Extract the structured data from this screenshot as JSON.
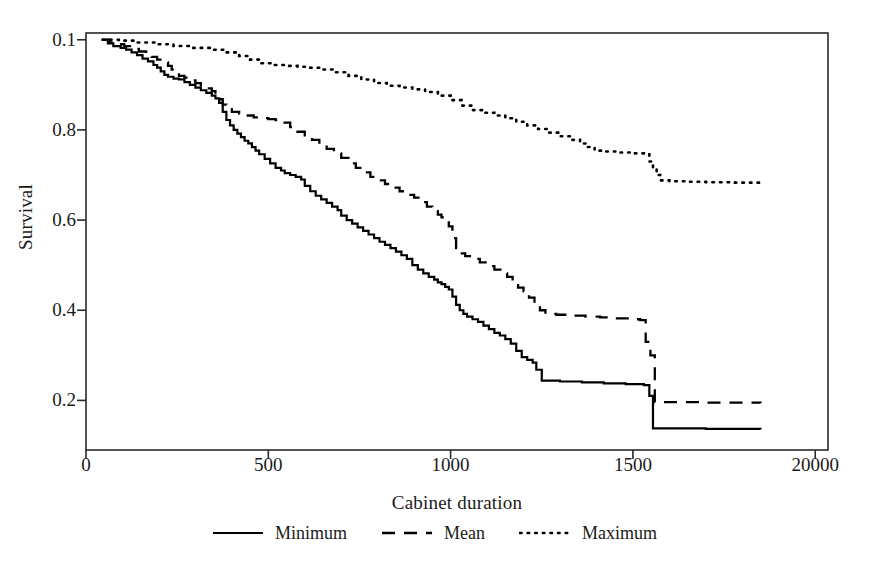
{
  "chart_data": {
    "type": "line",
    "title": "",
    "subtitle": "",
    "xlabel": "Cabinet duration",
    "ylabel": "Survival",
    "xlim": [
      0,
      2035
    ],
    "ylim": [
      0.09,
      1.015
    ],
    "grid": false,
    "legend_position": "bottom-center",
    "xticks": [
      {
        "value": 0,
        "label": "0"
      },
      {
        "value": 500,
        "label": "500"
      },
      {
        "value": 1000,
        "label": "1000"
      },
      {
        "value": 1500,
        "label": "1500"
      },
      {
        "value": 2000,
        "label": "20000"
      }
    ],
    "yticks": [
      {
        "value": 1.0,
        "label": "0.1"
      },
      {
        "value": 0.8,
        "label": "0.8"
      },
      {
        "value": 0.6,
        "label": "0.6"
      },
      {
        "value": 0.4,
        "label": "0.4"
      },
      {
        "value": 0.2,
        "label": "0.2"
      }
    ],
    "note_on_tick_labels": "Top y tick prints as 0.1 and last x tick prints as 20000 exactly as rendered in the source image",
    "series": [
      {
        "name": "Minimum",
        "style": "solid",
        "color": "#000000",
        "points": [
          [
            45,
            1.0
          ],
          [
            60,
            0.992
          ],
          [
            75,
            0.986
          ],
          [
            95,
            0.982
          ],
          [
            110,
            0.978
          ],
          [
            125,
            0.972
          ],
          [
            140,
            0.966
          ],
          [
            155,
            0.958
          ],
          [
            170,
            0.952
          ],
          [
            185,
            0.944
          ],
          [
            195,
            0.938
          ],
          [
            205,
            0.93
          ],
          [
            215,
            0.922
          ],
          [
            225,
            0.918
          ],
          [
            240,
            0.914
          ],
          [
            255,
            0.912
          ],
          [
            270,
            0.906
          ],
          [
            285,
            0.9
          ],
          [
            300,
            0.894
          ],
          [
            315,
            0.888
          ],
          [
            330,
            0.882
          ],
          [
            345,
            0.876
          ],
          [
            355,
            0.87
          ],
          [
            365,
            0.86
          ],
          [
            375,
            0.84
          ],
          [
            385,
            0.822
          ],
          [
            395,
            0.81
          ],
          [
            405,
            0.8
          ],
          [
            415,
            0.792
          ],
          [
            425,
            0.784
          ],
          [
            435,
            0.776
          ],
          [
            445,
            0.77
          ],
          [
            455,
            0.762
          ],
          [
            465,
            0.754
          ],
          [
            475,
            0.746
          ],
          [
            490,
            0.736
          ],
          [
            505,
            0.726
          ],
          [
            520,
            0.716
          ],
          [
            535,
            0.71
          ],
          [
            545,
            0.704
          ],
          [
            560,
            0.7
          ],
          [
            575,
            0.696
          ],
          [
            590,
            0.69
          ],
          [
            600,
            0.676
          ],
          [
            615,
            0.664
          ],
          [
            630,
            0.654
          ],
          [
            645,
            0.646
          ],
          [
            660,
            0.638
          ],
          [
            675,
            0.63
          ],
          [
            690,
            0.622
          ],
          [
            700,
            0.61
          ],
          [
            715,
            0.6
          ],
          [
            730,
            0.592
          ],
          [
            745,
            0.584
          ],
          [
            760,
            0.576
          ],
          [
            775,
            0.568
          ],
          [
            790,
            0.56
          ],
          [
            805,
            0.552
          ],
          [
            820,
            0.545
          ],
          [
            835,
            0.538
          ],
          [
            850,
            0.53
          ],
          [
            865,
            0.522
          ],
          [
            880,
            0.514
          ],
          [
            895,
            0.5
          ],
          [
            910,
            0.49
          ],
          [
            925,
            0.482
          ],
          [
            940,
            0.474
          ],
          [
            955,
            0.468
          ],
          [
            965,
            0.462
          ],
          [
            975,
            0.458
          ],
          [
            985,
            0.452
          ],
          [
            995,
            0.446
          ],
          [
            1005,
            0.43
          ],
          [
            1015,
            0.412
          ],
          [
            1025,
            0.4
          ],
          [
            1035,
            0.392
          ],
          [
            1045,
            0.386
          ],
          [
            1060,
            0.38
          ],
          [
            1075,
            0.374
          ],
          [
            1090,
            0.366
          ],
          [
            1105,
            0.358
          ],
          [
            1120,
            0.35
          ],
          [
            1135,
            0.344
          ],
          [
            1150,
            0.336
          ],
          [
            1165,
            0.326
          ],
          [
            1180,
            0.31
          ],
          [
            1195,
            0.296
          ],
          [
            1210,
            0.29
          ],
          [
            1225,
            0.284
          ],
          [
            1235,
            0.268
          ],
          [
            1250,
            0.244
          ],
          [
            1300,
            0.242
          ],
          [
            1360,
            0.24
          ],
          [
            1420,
            0.238
          ],
          [
            1480,
            0.236
          ],
          [
            1530,
            0.234
          ],
          [
            1545,
            0.21
          ],
          [
            1555,
            0.138
          ],
          [
            1700,
            0.137
          ],
          [
            1850,
            0.136
          ]
        ]
      },
      {
        "name": "Mean",
        "style": "dashed",
        "color": "#000000",
        "points": [
          [
            45,
            1.0
          ],
          [
            65,
            0.994
          ],
          [
            85,
            0.99
          ],
          [
            105,
            0.986
          ],
          [
            125,
            0.98
          ],
          [
            145,
            0.974
          ],
          [
            165,
            0.968
          ],
          [
            180,
            0.962
          ],
          [
            195,
            0.956
          ],
          [
            210,
            0.95
          ],
          [
            225,
            0.942
          ],
          [
            235,
            0.934
          ],
          [
            245,
            0.926
          ],
          [
            255,
            0.92
          ],
          [
            270,
            0.916
          ],
          [
            285,
            0.91
          ],
          [
            300,
            0.904
          ],
          [
            315,
            0.898
          ],
          [
            330,
            0.892
          ],
          [
            345,
            0.886
          ],
          [
            355,
            0.878
          ],
          [
            365,
            0.868
          ],
          [
            375,
            0.856
          ],
          [
            385,
            0.846
          ],
          [
            400,
            0.84
          ],
          [
            420,
            0.836
          ],
          [
            440,
            0.832
          ],
          [
            460,
            0.828
          ],
          [
            480,
            0.826
          ],
          [
            500,
            0.824
          ],
          [
            520,
            0.822
          ],
          [
            540,
            0.816
          ],
          [
            560,
            0.806
          ],
          [
            580,
            0.796
          ],
          [
            600,
            0.788
          ],
          [
            620,
            0.778
          ],
          [
            640,
            0.768
          ],
          [
            660,
            0.758
          ],
          [
            680,
            0.748
          ],
          [
            700,
            0.738
          ],
          [
            720,
            0.726
          ],
          [
            740,
            0.716
          ],
          [
            760,
            0.706
          ],
          [
            780,
            0.696
          ],
          [
            800,
            0.688
          ],
          [
            820,
            0.68
          ],
          [
            840,
            0.672
          ],
          [
            860,
            0.664
          ],
          [
            880,
            0.656
          ],
          [
            900,
            0.65
          ],
          [
            920,
            0.64
          ],
          [
            935,
            0.63
          ],
          [
            950,
            0.62
          ],
          [
            965,
            0.612
          ],
          [
            975,
            0.606
          ],
          [
            985,
            0.6
          ],
          [
            995,
            0.586
          ],
          [
            1005,
            0.56
          ],
          [
            1015,
            0.538
          ],
          [
            1025,
            0.526
          ],
          [
            1040,
            0.52
          ],
          [
            1060,
            0.514
          ],
          [
            1080,
            0.506
          ],
          [
            1100,
            0.498
          ],
          [
            1120,
            0.49
          ],
          [
            1140,
            0.482
          ],
          [
            1155,
            0.474
          ],
          [
            1170,
            0.462
          ],
          [
            1185,
            0.45
          ],
          [
            1200,
            0.442
          ],
          [
            1215,
            0.428
          ],
          [
            1230,
            0.412
          ],
          [
            1245,
            0.4
          ],
          [
            1260,
            0.392
          ],
          [
            1290,
            0.39
          ],
          [
            1330,
            0.388
          ],
          [
            1370,
            0.386
          ],
          [
            1410,
            0.384
          ],
          [
            1450,
            0.382
          ],
          [
            1490,
            0.38
          ],
          [
            1520,
            0.378
          ],
          [
            1535,
            0.33
          ],
          [
            1548,
            0.3
          ],
          [
            1560,
            0.196
          ],
          [
            1700,
            0.195
          ],
          [
            1850,
            0.194
          ]
        ]
      },
      {
        "name": "Maximum",
        "style": "dotted",
        "color": "#000000",
        "points": [
          [
            45,
            1.0
          ],
          [
            90,
            0.998
          ],
          [
            140,
            0.994
          ],
          [
            190,
            0.99
          ],
          [
            240,
            0.986
          ],
          [
            290,
            0.982
          ],
          [
            340,
            0.978
          ],
          [
            380,
            0.972
          ],
          [
            420,
            0.964
          ],
          [
            450,
            0.956
          ],
          [
            480,
            0.948
          ],
          [
            510,
            0.944
          ],
          [
            545,
            0.942
          ],
          [
            580,
            0.94
          ],
          [
            615,
            0.938
          ],
          [
            650,
            0.934
          ],
          [
            685,
            0.928
          ],
          [
            720,
            0.92
          ],
          [
            755,
            0.912
          ],
          [
            790,
            0.904
          ],
          [
            825,
            0.898
          ],
          [
            860,
            0.894
          ],
          [
            895,
            0.89
          ],
          [
            930,
            0.884
          ],
          [
            965,
            0.876
          ],
          [
            1000,
            0.866
          ],
          [
            1030,
            0.854
          ],
          [
            1060,
            0.844
          ],
          [
            1090,
            0.838
          ],
          [
            1120,
            0.832
          ],
          [
            1150,
            0.826
          ],
          [
            1180,
            0.818
          ],
          [
            1210,
            0.81
          ],
          [
            1240,
            0.802
          ],
          [
            1270,
            0.794
          ],
          [
            1300,
            0.786
          ],
          [
            1330,
            0.778
          ],
          [
            1355,
            0.77
          ],
          [
            1375,
            0.762
          ],
          [
            1395,
            0.754
          ],
          [
            1420,
            0.752
          ],
          [
            1460,
            0.75
          ],
          [
            1500,
            0.748
          ],
          [
            1530,
            0.746
          ],
          [
            1545,
            0.73
          ],
          [
            1555,
            0.716
          ],
          [
            1565,
            0.7
          ],
          [
            1575,
            0.688
          ],
          [
            1600,
            0.686
          ],
          [
            1650,
            0.685
          ],
          [
            1700,
            0.684
          ],
          [
            1780,
            0.683
          ],
          [
            1850,
            0.682
          ]
        ]
      }
    ],
    "legend": [
      {
        "label": "Minimum",
        "style": "solid"
      },
      {
        "label": "Mean",
        "style": "dashed"
      },
      {
        "label": "Maximum",
        "style": "dotted"
      }
    ],
    "axis_color": "#2a2a2a",
    "background": "#ffffff"
  }
}
